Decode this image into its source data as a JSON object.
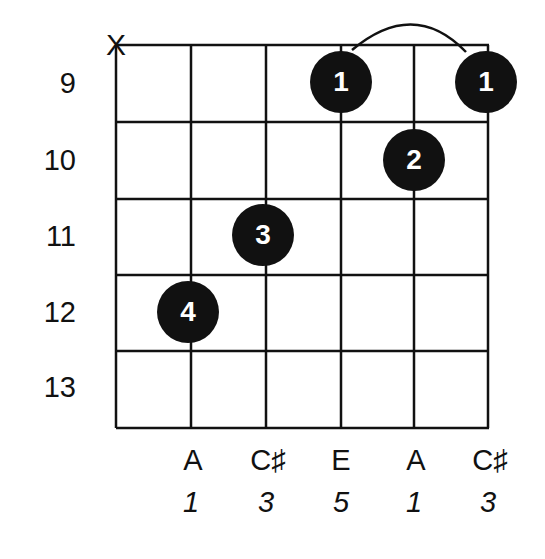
{
  "chord": {
    "strings": 6,
    "frets_shown": [
      9,
      10,
      11,
      12,
      13
    ],
    "muted_strings": [
      1
    ],
    "mute_symbol": "X",
    "notes": [
      "",
      "A",
      "C♯",
      "E",
      "A",
      "C♯"
    ],
    "intervals": [
      "",
      "1",
      "3",
      "5",
      "1",
      "3"
    ],
    "fingerings": [
      {
        "string": 2,
        "fret": 12,
        "finger": "4"
      },
      {
        "string": 3,
        "fret": 11,
        "finger": "3"
      },
      {
        "string": 4,
        "fret": 9,
        "finger": "1"
      },
      {
        "string": 5,
        "fret": 10,
        "finger": "2"
      },
      {
        "string": 6,
        "fret": 9,
        "finger": "1"
      }
    ],
    "barre": {
      "from_string": 4,
      "to_string": 6,
      "fret": 9
    }
  },
  "labels": {
    "fret_9": "9",
    "fret_10": "10",
    "fret_11": "11",
    "fret_12": "12",
    "fret_13": "13",
    "note_2": "A",
    "note_3": "C♯",
    "note_4": "E",
    "note_5": "A",
    "note_6": "C♯",
    "interval_2": "1",
    "interval_3": "3",
    "interval_4": "5",
    "interval_5": "1",
    "interval_6": "3",
    "finger_s2": "4",
    "finger_s3": "3",
    "finger_s4": "1",
    "finger_s5": "2",
    "finger_s6": "1",
    "mute": "X"
  },
  "colors": {
    "ink": "#111111",
    "background": "#ffffff",
    "dot_text": "#ffffff"
  }
}
